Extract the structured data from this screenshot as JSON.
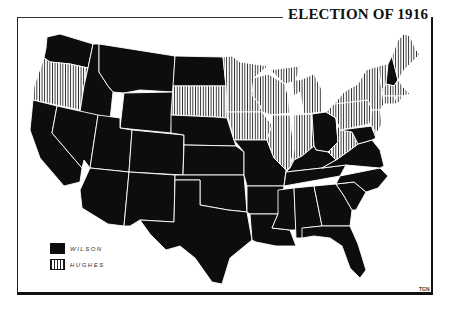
{
  "map": {
    "title": "ELECTION OF 1916",
    "credit": "TGN",
    "legend": [
      {
        "key": "wilson",
        "label": "WILSON",
        "fill": "solid-black",
        "color": "#0d0d0d"
      },
      {
        "key": "hughes",
        "label": "HUGHES",
        "fill": "vertical-hatch",
        "color": "#ffffff"
      }
    ],
    "states": {
      "wilson": [
        "WA",
        "ID",
        "MT",
        "WY",
        "ND",
        "NE",
        "KS",
        "OK",
        "TX",
        "CA",
        "NV",
        "UT",
        "CO",
        "AZ",
        "NM",
        "MO",
        "AR",
        "LA",
        "MS",
        "AL",
        "GA",
        "FL",
        "SC",
        "NC",
        "TN",
        "KY",
        "VA",
        "MD",
        "OH",
        "NH"
      ],
      "hughes": [
        "OR",
        "SD",
        "MN",
        "WI",
        "IA",
        "IL",
        "MI",
        "IN",
        "WV",
        "PA",
        "NY",
        "NJ",
        "DE",
        "CT",
        "RI",
        "MA",
        "VT",
        "ME"
      ]
    }
  }
}
